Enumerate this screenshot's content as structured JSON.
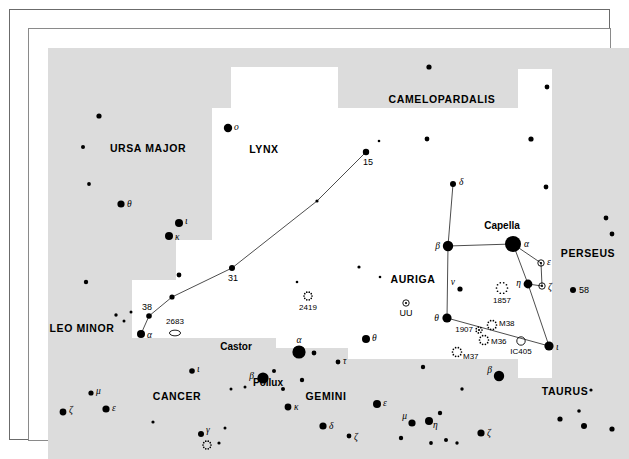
{
  "chart_data": {
    "type": "scatter",
    "xlabel": "",
    "ylabel": "",
    "background": {
      "sky_fill": "#dcdcdc",
      "region_fill": "#ffffff",
      "star_color": "#000000"
    },
    "constellations": [
      {
        "name": "CAMELOPARDALIS",
        "x": 413,
        "y": 74,
        "shaded": true
      },
      {
        "name": "URSA MAJOR",
        "x": 119,
        "y": 123,
        "shaded": true
      },
      {
        "name": "LYNX",
        "x": 235,
        "y": 124,
        "shaded": false
      },
      {
        "name": "AURIGA",
        "x": 384,
        "y": 254,
        "shaded": false
      },
      {
        "name": "PERSEUS",
        "x": 559,
        "y": 228,
        "shaded": true
      },
      {
        "name": "LEO MINOR",
        "x": 53,
        "y": 303,
        "shaded": true
      },
      {
        "name": "CANCER",
        "x": 148,
        "y": 371,
        "shaded": true
      },
      {
        "name": "GEMINI",
        "x": 297,
        "y": 371,
        "shaded": true
      },
      {
        "name": "TAURUS",
        "x": 536,
        "y": 366,
        "shaded": true
      }
    ],
    "proper_names": [
      {
        "label": "Capella",
        "x": 473,
        "y": 200
      },
      {
        "label": "Castor",
        "x": 207,
        "y": 321
      },
      {
        "label": "Pollux",
        "x": 239,
        "y": 357
      }
    ],
    "stars": [
      {
        "id": "uma-o",
        "label": "o",
        "type": "greek",
        "x": 199,
        "y": 99,
        "r": 4.2
      },
      {
        "id": "uma-a1",
        "label": "",
        "type": "plain",
        "x": 70,
        "y": 87,
        "r": 2.6
      },
      {
        "id": "uma-a2",
        "label": "",
        "type": "plain",
        "x": 54,
        "y": 118,
        "r": 2.0
      },
      {
        "id": "uma-a3",
        "label": "",
        "type": "plain",
        "x": 60,
        "y": 155,
        "r": 1.9
      },
      {
        "id": "uma-th",
        "label": "θ",
        "type": "greek",
        "x": 92,
        "y": 175,
        "r": 3.6
      },
      {
        "id": "uma-io",
        "label": "ι",
        "type": "greek",
        "x": 150,
        "y": 194,
        "r": 4.0
      },
      {
        "id": "uma-ka",
        "label": "κ",
        "type": "greek",
        "x": 140,
        "y": 207,
        "r": 4.0
      },
      {
        "id": "uma-a4",
        "label": "",
        "type": "plain",
        "x": 150,
        "y": 246,
        "r": 2.4
      },
      {
        "id": "uma-a5",
        "label": "",
        "type": "plain",
        "x": 57,
        "y": 253,
        "r": 2.2
      },
      {
        "id": "cam-b1",
        "label": "",
        "type": "plain",
        "x": 400,
        "y": 38,
        "r": 2.6
      },
      {
        "id": "cam-b2",
        "label": "",
        "type": "plain",
        "x": 518,
        "y": 58,
        "r": 2.4
      },
      {
        "id": "cam-b3",
        "label": "",
        "type": "plain",
        "x": 398,
        "y": 110,
        "r": 2.4
      },
      {
        "id": "cam-b4",
        "label": "",
        "type": "plain",
        "x": 502,
        "y": 110,
        "r": 2.6
      },
      {
        "id": "cam-b5",
        "label": "",
        "type": "plain",
        "x": 517,
        "y": 158,
        "r": 2.4
      },
      {
        "id": "lyn-15",
        "label": "15",
        "type": "number",
        "x": 337,
        "y": 123,
        "r": 3.2
      },
      {
        "id": "lyn-x1",
        "label": "",
        "type": "plain",
        "x": 350,
        "y": 112,
        "r": 1.3
      },
      {
        "id": "lyn-mid",
        "label": "",
        "type": "plain",
        "x": 288,
        "y": 172,
        "r": 1.6
      },
      {
        "id": "lyn-31",
        "label": "31",
        "type": "number",
        "x": 203,
        "y": 239,
        "r": 3.0
      },
      {
        "id": "lyn-m2",
        "label": "",
        "type": "plain",
        "x": 143,
        "y": 268,
        "r": 2.6
      },
      {
        "id": "lyn-38",
        "label": "38",
        "type": "number",
        "x": 120,
        "y": 287,
        "r": 2.8
      },
      {
        "id": "lyn-al",
        "label": "α",
        "type": "greek",
        "x": 112,
        "y": 305,
        "r": 4.0
      },
      {
        "id": "lyn-d1",
        "label": "",
        "type": "plain",
        "x": 268,
        "y": 253,
        "r": 1.3
      },
      {
        "id": "lyn-d2",
        "label": "",
        "type": "plain",
        "x": 330,
        "y": 238,
        "r": 1.6
      },
      {
        "id": "lyn-d3",
        "label": "",
        "type": "plain",
        "x": 351,
        "y": 248,
        "r": 1.3
      },
      {
        "id": "lmi-c1",
        "label": "",
        "type": "plain",
        "x": 87,
        "y": 286,
        "r": 1.7
      },
      {
        "id": "lmi-c2",
        "label": "",
        "type": "plain",
        "x": 95,
        "y": 292,
        "r": 1.5
      },
      {
        "id": "lmi-c3",
        "label": "",
        "type": "plain",
        "x": 102,
        "y": 283,
        "r": 1.5
      },
      {
        "id": "aur-de",
        "label": "δ",
        "type": "greek",
        "x": 424,
        "y": 155,
        "r": 3.0
      },
      {
        "id": "aur-be",
        "label": "β",
        "type": "greek",
        "x": 419,
        "y": 217,
        "r": 5.2
      },
      {
        "id": "aur-al",
        "label": "α",
        "type": "greek",
        "x": 484,
        "y": 215,
        "r": 8.0
      },
      {
        "id": "aur-et",
        "label": "η",
        "type": "greek",
        "x": 499,
        "y": 255,
        "r": 4.4
      },
      {
        "id": "aur-nu",
        "label": "ν",
        "type": "greek",
        "x": 431,
        "y": 260,
        "r": 2.6
      },
      {
        "id": "aur-th",
        "label": "θ",
        "type": "greek",
        "x": 418,
        "y": 289,
        "r": 4.6
      },
      {
        "id": "aur-io",
        "label": "ι",
        "type": "greek",
        "x": 520,
        "y": 317,
        "r": 4.6
      },
      {
        "id": "aur-ep",
        "label": "ε",
        "type": "variable",
        "x": 512,
        "y": 234,
        "r": 3.2
      },
      {
        "id": "aur-ze",
        "label": "ζ",
        "type": "variable",
        "x": 513,
        "y": 257,
        "r": 3.2
      },
      {
        "id": "aur-uu",
        "label": "UU",
        "type": "variable-named",
        "x": 377,
        "y": 274,
        "r": 3.2
      },
      {
        "id": "per-58",
        "label": "58",
        "type": "number",
        "x": 544,
        "y": 261,
        "r": 3.0
      },
      {
        "id": "per-p1",
        "label": "",
        "type": "plain",
        "x": 577,
        "y": 189,
        "r": 2.4
      },
      {
        "id": "per-p2",
        "label": "",
        "type": "plain",
        "x": 583,
        "y": 205,
        "r": 2.4
      },
      {
        "id": "gem-al",
        "label": "α",
        "type": "greek",
        "x": 270,
        "y": 323,
        "r": 6.6
      },
      {
        "id": "gem-a2",
        "label": "",
        "type": "plain",
        "x": 285,
        "y": 324,
        "r": 2.4
      },
      {
        "id": "gem-be",
        "label": "β",
        "type": "greek",
        "x": 234,
        "y": 349,
        "r": 5.6
      },
      {
        "id": "gem-b2",
        "label": "",
        "type": "plain",
        "x": 245,
        "y": 342,
        "r": 2.0
      },
      {
        "id": "gem-b3",
        "label": "",
        "type": "plain",
        "x": 273,
        "y": 351,
        "r": 2.2
      },
      {
        "id": "gem-b4",
        "label": "",
        "type": "plain",
        "x": 254,
        "y": 360,
        "r": 2.0
      },
      {
        "id": "gem-th",
        "label": "θ",
        "type": "greek",
        "x": 337,
        "y": 310,
        "r": 4.0
      },
      {
        "id": "gem-ta",
        "label": "τ",
        "type": "greek",
        "x": 309,
        "y": 333,
        "r": 2.4
      },
      {
        "id": "gem-ka",
        "label": "κ",
        "type": "greek",
        "x": 259,
        "y": 378,
        "r": 3.4
      },
      {
        "id": "gem-de",
        "label": "δ",
        "type": "greek",
        "x": 294,
        "y": 397,
        "r": 3.6
      },
      {
        "id": "gem-ze",
        "label": "ζ",
        "type": "greek",
        "x": 320,
        "y": 407,
        "r": 2.4
      },
      {
        "id": "gem-ep",
        "label": "ε",
        "type": "greek",
        "x": 348,
        "y": 375,
        "r": 4.0
      },
      {
        "id": "gem-mu",
        "label": "μ",
        "type": "greek",
        "x": 383,
        "y": 394,
        "r": 3.6
      },
      {
        "id": "gem-et",
        "label": "η",
        "type": "greek",
        "x": 400,
        "y": 392,
        "r": 4.0
      },
      {
        "id": "gem-g1",
        "label": "",
        "type": "plain",
        "x": 411,
        "y": 384,
        "r": 2.2
      },
      {
        "id": "gem-g2",
        "label": "",
        "type": "plain",
        "x": 372,
        "y": 409,
        "r": 2.2
      },
      {
        "id": "gem-g3",
        "label": "",
        "type": "plain",
        "x": 402,
        "y": 414,
        "r": 1.9
      },
      {
        "id": "gem-g4",
        "label": "",
        "type": "plain",
        "x": 417,
        "y": 411,
        "r": 2.0
      },
      {
        "id": "gem-g5",
        "label": "",
        "type": "plain",
        "x": 216,
        "y": 358,
        "r": 1.5
      },
      {
        "id": "gem-g6",
        "label": "",
        "type": "plain",
        "x": 196,
        "y": 399,
        "r": 1.5
      },
      {
        "id": "gem-g7",
        "label": "",
        "type": "plain",
        "x": 394,
        "y": 338,
        "r": 2.2
      },
      {
        "id": "cnc-io",
        "label": "ι",
        "type": "greek",
        "x": 163,
        "y": 342,
        "r": 2.8
      },
      {
        "id": "cnc-mu",
        "label": "μ",
        "type": "greek",
        "x": 62,
        "y": 364,
        "r": 2.6
      },
      {
        "id": "cnc-ep",
        "label": "ε",
        "type": "greek",
        "x": 77,
        "y": 380,
        "r": 3.6
      },
      {
        "id": "cnc-ze",
        "label": "ζ",
        "type": "greek",
        "x": 34,
        "y": 383,
        "r": 3.4
      },
      {
        "id": "cnc-ga",
        "label": "γ",
        "type": "greek",
        "x": 172,
        "y": 405,
        "r": 3.0
      },
      {
        "id": "cnc-c1",
        "label": "",
        "type": "plain",
        "x": 124,
        "y": 393,
        "r": 1.6
      },
      {
        "id": "cnc-c2",
        "label": "",
        "type": "plain",
        "x": 190,
        "y": 414,
        "r": 1.6
      },
      {
        "id": "cnc-c3",
        "label": "",
        "type": "plain",
        "x": 202,
        "y": 360,
        "r": 1.5
      },
      {
        "id": "tau-be",
        "label": "β",
        "type": "greek",
        "x": 470,
        "y": 347,
        "r": 5.2
      },
      {
        "id": "tau-ze",
        "label": "ζ",
        "type": "greek",
        "x": 452,
        "y": 404,
        "r": 3.6
      },
      {
        "id": "tau-t1",
        "label": "",
        "type": "plain",
        "x": 531,
        "y": 390,
        "r": 2.6
      },
      {
        "id": "tau-t2",
        "label": "",
        "type": "plain",
        "x": 555,
        "y": 397,
        "r": 3.0
      },
      {
        "id": "tau-t3",
        "label": "",
        "type": "plain",
        "x": 550,
        "y": 382,
        "r": 1.8
      },
      {
        "id": "tau-t4",
        "label": "",
        "type": "plain",
        "x": 583,
        "y": 400,
        "r": 2.6
      },
      {
        "id": "tau-t5",
        "label": "",
        "type": "plain",
        "x": 562,
        "y": 361,
        "r": 1.6
      },
      {
        "id": "tau-t6",
        "label": "",
        "type": "plain",
        "x": 433,
        "y": 360,
        "r": 1.7
      },
      {
        "id": "tau-t7",
        "label": "",
        "type": "plain",
        "x": 428,
        "y": 414,
        "r": 1.7
      }
    ],
    "deep_sky": [
      {
        "id": "ngc2419",
        "label": "2419",
        "shape": "cluster-dotted",
        "x": 279,
        "y": 267,
        "r": 4.0
      },
      {
        "id": "ngc2683",
        "label": "2683",
        "shape": "galaxy-ellipse",
        "x": 146,
        "y": 304,
        "r": 5.5
      },
      {
        "id": "ngc1857",
        "label": "1857",
        "shape": "cluster-dotted",
        "x": 473,
        "y": 259,
        "r": 5.5
      },
      {
        "id": "ngc1907",
        "label": "1907",
        "shape": "cluster-small",
        "x": 450,
        "y": 301,
        "r": 3.0
      },
      {
        "id": "m38",
        "label": "M38",
        "shape": "cluster-dotted",
        "x": 463,
        "y": 296,
        "r": 4.5
      },
      {
        "id": "m36",
        "label": "M36",
        "shape": "cluster-dotted",
        "x": 455,
        "y": 311,
        "r": 4.5
      },
      {
        "id": "m37",
        "label": "M37",
        "shape": "cluster-dotted",
        "x": 428,
        "y": 323,
        "r": 4.5
      },
      {
        "id": "ic405",
        "label": "IC405",
        "shape": "nebula-circle",
        "x": 492,
        "y": 312,
        "r": 4.2
      },
      {
        "id": "cnc-m67",
        "label": "",
        "shape": "cluster-dotted",
        "x": 178,
        "y": 416,
        "r": 4.0
      }
    ],
    "constellation_lines": [
      {
        "name": "lynx-chain",
        "points": [
          [
            337,
            123
          ],
          [
            288,
            172
          ],
          [
            203,
            239
          ],
          [
            143,
            268
          ],
          [
            120,
            287
          ],
          [
            112,
            305
          ]
        ]
      },
      {
        "name": "auriga-delta-beta",
        "points": [
          [
            424,
            155
          ],
          [
            419,
            217
          ]
        ]
      },
      {
        "name": "auriga-beta-alpha",
        "points": [
          [
            419,
            217
          ],
          [
            484,
            215
          ]
        ]
      },
      {
        "name": "auriga-beta-theta",
        "points": [
          [
            419,
            217
          ],
          [
            418,
            289
          ]
        ]
      },
      {
        "name": "auriga-alpha-eta",
        "points": [
          [
            484,
            215
          ],
          [
            499,
            255
          ]
        ]
      },
      {
        "name": "auriga-alpha-epsilon",
        "points": [
          [
            484,
            215
          ],
          [
            512,
            234
          ]
        ]
      },
      {
        "name": "auriga-eta-iota",
        "points": [
          [
            499,
            255
          ],
          [
            520,
            317
          ]
        ]
      },
      {
        "name": "auriga-eta-zeta",
        "points": [
          [
            499,
            255
          ],
          [
            513,
            257
          ]
        ]
      },
      {
        "name": "auriga-epsilon-zeta",
        "points": [
          [
            512,
            234
          ],
          [
            513,
            257
          ]
        ]
      },
      {
        "name": "auriga-theta-iota",
        "points": [
          [
            418,
            289
          ],
          [
            520,
            317
          ]
        ]
      }
    ],
    "region_boundaries": {
      "description": "White (unshaded) regions mark Lynx, Auriga and the charted field; surrounding area is light grey."
    }
  }
}
